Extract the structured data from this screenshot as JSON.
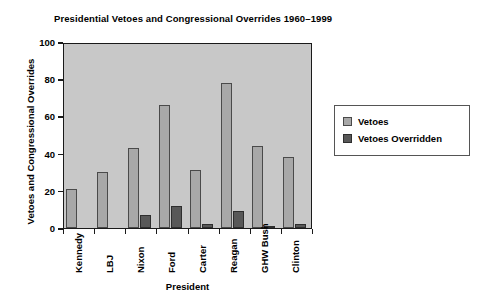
{
  "chart_data": {
    "type": "bar",
    "title": "Presidential Vetoes and Congressional Overrides 1960–1999",
    "xlabel": "President",
    "ylabel": "Vetoes and Congressional Overrides",
    "categories": [
      "Kennedy",
      "LBJ",
      "Nixon",
      "Ford",
      "Carter",
      "Reagan",
      "GHW Bush",
      "Clinton"
    ],
    "series": [
      {
        "name": "Vetoes",
        "color": "#a8a8a8",
        "values": [
          21,
          30,
          43,
          66,
          31,
          78,
          44,
          38
        ]
      },
      {
        "name": "Vetoes Overridden",
        "color": "#585858",
        "values": [
          0,
          0,
          7,
          12,
          2,
          9,
          1,
          2
        ]
      }
    ],
    "ylim": [
      0,
      100
    ],
    "y_ticks": [
      "0",
      "20",
      "40",
      "60",
      "80",
      "100"
    ],
    "y_tick_values": [
      0,
      20,
      40,
      60,
      80,
      100
    ],
    "grid": false,
    "legend_position": "right",
    "plot_background": "#c8c8c8",
    "figure_background": "#ffffff",
    "axis_color": "#1a1a1a"
  },
  "legend": {
    "items": [
      {
        "label": "Vetoes",
        "swatch": "legend-swatch-vetoes"
      },
      {
        "label": "Vetoes Overridden",
        "swatch": "legend-swatch-overridden"
      }
    ]
  }
}
